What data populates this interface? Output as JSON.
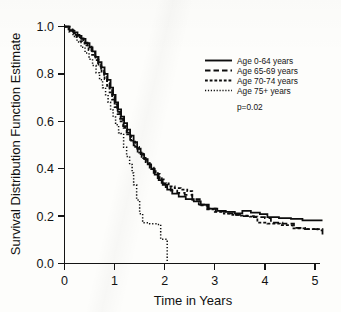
{
  "chart_data": {
    "type": "line",
    "title": "",
    "subtitle": "",
    "xlabel": "Time in Years",
    "ylabel": "Survival Distribution Function Estimate",
    "xlim": [
      0,
      5.2
    ],
    "ylim": [
      0,
      1.0
    ],
    "xticks": [
      "0",
      "1",
      "2",
      "3",
      "4",
      "5"
    ],
    "xtick_values": [
      0,
      1,
      2,
      3,
      4,
      5
    ],
    "yticks": [
      "0.0",
      "0.2",
      "0.4",
      "0.6",
      "0.8",
      "1.0"
    ],
    "ytick_values": [
      0.0,
      0.2,
      0.4,
      0.6,
      0.8,
      1.0
    ],
    "grid": false,
    "legend_position": "upper-right",
    "annotations": [
      {
        "text": "p=0.02",
        "x": 3.05,
        "y": 0.6
      }
    ],
    "series": [
      {
        "name": "Age 0-64 years",
        "style": "solid",
        "color": "#0d0d0d",
        "points": [
          [
            0.0,
            1.0
          ],
          [
            0.1,
            0.985
          ],
          [
            0.18,
            0.975
          ],
          [
            0.26,
            0.96
          ],
          [
            0.34,
            0.948
          ],
          [
            0.42,
            0.93
          ],
          [
            0.5,
            0.912
          ],
          [
            0.56,
            0.895
          ],
          [
            0.62,
            0.872
          ],
          [
            0.68,
            0.85
          ],
          [
            0.74,
            0.828
          ],
          [
            0.8,
            0.8
          ],
          [
            0.86,
            0.775
          ],
          [
            0.92,
            0.742
          ],
          [
            0.97,
            0.712
          ],
          [
            1.02,
            0.68
          ],
          [
            1.07,
            0.65
          ],
          [
            1.13,
            0.62
          ],
          [
            1.19,
            0.592
          ],
          [
            1.25,
            0.565
          ],
          [
            1.31,
            0.54
          ],
          [
            1.38,
            0.512
          ],
          [
            1.45,
            0.485
          ],
          [
            1.52,
            0.462
          ],
          [
            1.59,
            0.44
          ],
          [
            1.66,
            0.418
          ],
          [
            1.73,
            0.398
          ],
          [
            1.8,
            0.375
          ],
          [
            1.88,
            0.352
          ],
          [
            1.96,
            0.332
          ],
          [
            2.05,
            0.312
          ],
          [
            2.15,
            0.295
          ],
          [
            2.28,
            0.282
          ],
          [
            2.42,
            0.272
          ],
          [
            2.58,
            0.262
          ],
          [
            2.72,
            0.248
          ],
          [
            2.88,
            0.232
          ],
          [
            3.05,
            0.222
          ],
          [
            3.22,
            0.218
          ],
          [
            3.4,
            0.212
          ],
          [
            3.55,
            0.222
          ],
          [
            3.72,
            0.215
          ],
          [
            3.9,
            0.208
          ],
          [
            4.05,
            0.196
          ],
          [
            4.28,
            0.192
          ],
          [
            4.52,
            0.188
          ],
          [
            4.75,
            0.182
          ],
          [
            5.15,
            0.182
          ]
        ]
      },
      {
        "name": "Age 65-69 years",
        "style": "long-dash",
        "color": "#0d0d0d",
        "points": [
          [
            0.0,
            1.0
          ],
          [
            0.12,
            0.982
          ],
          [
            0.22,
            0.965
          ],
          [
            0.3,
            0.95
          ],
          [
            0.38,
            0.932
          ],
          [
            0.46,
            0.915
          ],
          [
            0.54,
            0.892
          ],
          [
            0.61,
            0.868
          ],
          [
            0.67,
            0.845
          ],
          [
            0.73,
            0.818
          ],
          [
            0.79,
            0.792
          ],
          [
            0.85,
            0.762
          ],
          [
            0.9,
            0.735
          ],
          [
            0.95,
            0.705
          ],
          [
            1.0,
            0.672
          ],
          [
            1.05,
            0.64
          ],
          [
            1.11,
            0.61
          ],
          [
            1.17,
            0.58
          ],
          [
            1.24,
            0.552
          ],
          [
            1.31,
            0.522
          ],
          [
            1.38,
            0.498
          ],
          [
            1.46,
            0.472
          ],
          [
            1.54,
            0.45
          ],
          [
            1.62,
            0.428
          ],
          [
            1.7,
            0.405
          ],
          [
            1.78,
            0.382
          ],
          [
            1.86,
            0.36
          ],
          [
            1.94,
            0.34
          ],
          [
            2.02,
            0.322
          ],
          [
            2.12,
            0.308
          ],
          [
            2.25,
            0.298
          ],
          [
            2.4,
            0.29
          ],
          [
            2.55,
            0.272
          ],
          [
            2.7,
            0.248
          ],
          [
            2.85,
            0.232
          ],
          [
            3.02,
            0.22
          ],
          [
            3.2,
            0.212
          ],
          [
            3.4,
            0.205
          ],
          [
            3.58,
            0.2
          ],
          [
            3.78,
            0.196
          ],
          [
            4.0,
            0.192
          ],
          [
            4.12,
            0.172
          ],
          [
            4.35,
            0.168
          ],
          [
            4.58,
            0.15
          ],
          [
            4.8,
            0.145
          ],
          [
            5.05,
            0.14
          ],
          [
            5.15,
            0.118
          ]
        ]
      },
      {
        "name": "Age 70-74 years",
        "style": "medium-dash",
        "color": "#0d0d0d",
        "points": [
          [
            0.0,
            1.0
          ],
          [
            0.08,
            0.988
          ],
          [
            0.16,
            0.972
          ],
          [
            0.24,
            0.955
          ],
          [
            0.32,
            0.938
          ],
          [
            0.4,
            0.92
          ],
          [
            0.48,
            0.9
          ],
          [
            0.55,
            0.88
          ],
          [
            0.62,
            0.858
          ],
          [
            0.68,
            0.832
          ],
          [
            0.74,
            0.805
          ],
          [
            0.8,
            0.778
          ],
          [
            0.85,
            0.75
          ],
          [
            0.9,
            0.722
          ],
          [
            0.95,
            0.692
          ],
          [
            1.0,
            0.66
          ],
          [
            1.06,
            0.63
          ],
          [
            1.12,
            0.6
          ],
          [
            1.18,
            0.572
          ],
          [
            1.25,
            0.545
          ],
          [
            1.33,
            0.518
          ],
          [
            1.41,
            0.492
          ],
          [
            1.49,
            0.468
          ],
          [
            1.57,
            0.445
          ],
          [
            1.65,
            0.422
          ],
          [
            1.73,
            0.4
          ],
          [
            1.82,
            0.378
          ],
          [
            1.9,
            0.355
          ],
          [
            1.98,
            0.338
          ],
          [
            2.08,
            0.325
          ],
          [
            2.2,
            0.318
          ],
          [
            2.32,
            0.312
          ],
          [
            2.45,
            0.305
          ],
          [
            2.55,
            0.268
          ],
          [
            2.68,
            0.245
          ],
          [
            2.85,
            0.228
          ],
          [
            3.0,
            0.218
          ],
          [
            3.18,
            0.21
          ],
          [
            3.35,
            0.205
          ],
          [
            3.52,
            0.202
          ],
          [
            3.7,
            0.198
          ],
          [
            3.85,
            0.172
          ],
          [
            4.05,
            0.168
          ],
          [
            4.3,
            0.162
          ],
          [
            4.55,
            0.148
          ],
          [
            4.8,
            0.145
          ],
          [
            5.15,
            0.142
          ]
        ]
      },
      {
        "name": "Age 75+ years",
        "style": "dotted",
        "color": "#0d0d0d",
        "points": [
          [
            0.0,
            1.0
          ],
          [
            0.09,
            0.978
          ],
          [
            0.17,
            0.958
          ],
          [
            0.25,
            0.935
          ],
          [
            0.33,
            0.912
          ],
          [
            0.41,
            0.888
          ],
          [
            0.49,
            0.862
          ],
          [
            0.56,
            0.835
          ],
          [
            0.63,
            0.805
          ],
          [
            0.7,
            0.775
          ],
          [
            0.76,
            0.742
          ],
          [
            0.82,
            0.712
          ],
          [
            0.87,
            0.68
          ],
          [
            0.92,
            0.648
          ],
          [
            0.97,
            0.618
          ],
          [
            1.02,
            0.585
          ],
          [
            1.08,
            0.552
          ],
          [
            1.12,
            0.548
          ],
          [
            1.18,
            0.49
          ],
          [
            1.24,
            0.452
          ],
          [
            1.3,
            0.418
          ],
          [
            1.35,
            0.382
          ],
          [
            1.38,
            0.332
          ],
          [
            1.44,
            0.268
          ],
          [
            1.5,
            0.21
          ],
          [
            1.56,
            0.172
          ],
          [
            1.7,
            0.168
          ],
          [
            1.85,
            0.165
          ],
          [
            1.92,
            0.102
          ],
          [
            2.05,
            0.1
          ],
          [
            2.05,
            0.0
          ]
        ]
      }
    ]
  },
  "legend": {
    "items": [
      {
        "label": "Age 0-64 years",
        "style": "solid"
      },
      {
        "label": "Age 65-69 years",
        "style": "long-dash"
      },
      {
        "label": "Age 70-74 years",
        "style": "medium-dash"
      },
      {
        "label": "Age 75+ years",
        "style": "dotted"
      }
    ],
    "pvalue": "p=0.02"
  }
}
